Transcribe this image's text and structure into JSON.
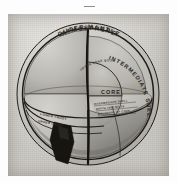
{
  "plate": {
    "title": "Cutaway diagram of the interior of the Earth",
    "medium": "halftone engraving on aged paper",
    "top_mark": "—"
  },
  "colors": {
    "paper": "#d4d2cc",
    "ink": "#2a2724",
    "outer_mantle_fill": "#c2c0ba",
    "intermediate_shell_fill": "#b9b7b1",
    "core_fill": "#b3b0a9",
    "cut_face_left": "#b8b6b0",
    "cut_face_lower": "#a9a7a1",
    "dark_wedge": "#17150f",
    "crust_band": "#cdcbc5",
    "line": "#1e1c19"
  },
  "labels": {
    "atmosphere": "ATMOSPHERE",
    "outer_mantle": "OUTER MANTLE",
    "intermediate_shell": "INTERMEDIATE SHELL",
    "core": "CORE",
    "lower_crust": "LOWER CRUST",
    "upper_crust": "UPPER CRUST",
    "annotation_core_top": "UPPER CORE BOUNDARY",
    "annotation_1": "INTERMEDIATE SHELL",
    "annotation_2": "DEPTH 1800 MILES",
    "annotation_3": "BOUNDARY OF CORE"
  },
  "structure": {
    "layers": [
      {
        "name": "ATMOSPHERE",
        "order": 1
      },
      {
        "name": "OUTER MANTLE",
        "order": 2
      },
      {
        "name": "INTERMEDIATE SHELL",
        "order": 3
      },
      {
        "name": "CORE",
        "order": 4
      },
      {
        "name": "LOWER CRUST",
        "order": 5
      },
      {
        "name": "UPPER CRUST",
        "order": 6
      }
    ]
  }
}
